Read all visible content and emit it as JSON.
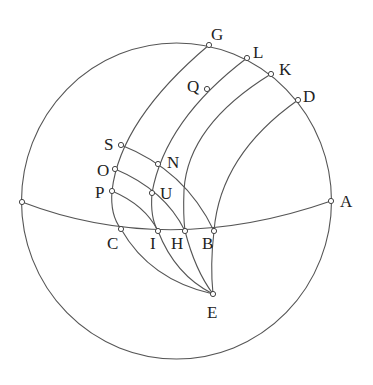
{
  "diagram": {
    "type": "spherical-geometry-figure",
    "sphere": {
      "cx": 176.5,
      "cy": 201,
      "rx": 155,
      "ry": 158
    },
    "points": {
      "A": {
        "x": 331,
        "y": 201,
        "lx": 340,
        "ly": 207
      },
      "B": {
        "x": 214,
        "y": 231,
        "lx": 202,
        "ly": 249
      },
      "C": {
        "x": 121,
        "y": 229,
        "lx": 107,
        "ly": 249
      },
      "D": {
        "x": 298,
        "y": 100,
        "lx": 303,
        "ly": 102
      },
      "E": {
        "x": 213,
        "y": 294,
        "lx": 207,
        "ly": 318
      },
      "G": {
        "x": 209,
        "y": 45,
        "lx": 211,
        "ly": 40
      },
      "H": {
        "x": 185,
        "y": 231,
        "lx": 171,
        "ly": 249
      },
      "I": {
        "x": 158,
        "y": 231,
        "lx": 150,
        "ly": 249
      },
      "K": {
        "x": 271,
        "y": 74,
        "lx": 279,
        "ly": 75
      },
      "L": {
        "x": 247,
        "y": 58,
        "lx": 253,
        "ly": 58
      },
      "N": {
        "x": 158,
        "y": 164,
        "lx": 167,
        "ly": 168
      },
      "O": {
        "x": 115,
        "y": 169,
        "lx": 97,
        "ly": 176
      },
      "P": {
        "x": 112,
        "y": 191,
        "lx": 95,
        "ly": 198
      },
      "Q": {
        "x": 207,
        "y": 89,
        "lx": 187,
        "ly": 92
      },
      "S": {
        "x": 121,
        "y": 145,
        "lx": 104,
        "ly": 150
      },
      "U": {
        "x": 152,
        "y": 193,
        "lx": 160,
        "ly": 199
      },
      "W": {
        "x": 22,
        "y": 202
      }
    },
    "labels": [
      "A",
      "B",
      "C",
      "D",
      "E",
      "G",
      "H",
      "I",
      "K",
      "L",
      "N",
      "O",
      "P",
      "Q",
      "S",
      "U"
    ],
    "curves": {
      "equator": "M22,202 Q168,258 331,201",
      "arc_G_C": "M209,45 Q120,120 112,191 Q110,215 121,229",
      "arc_L_I": "M247,58 Q165,120 152,193 Q150,218 158,231",
      "arc_K_H": "M271,74 Q188,125 184,190 Q183,215 185,231",
      "arc_D_B": "M298,100 Q220,155 214,231",
      "arc_S_B": "M121,145 Q185,170 214,231",
      "arc_O_H": "M115,169 Q165,190 185,231",
      "arc_P_I": "M112,191 Q145,205 158,231",
      "arc_C_E": "M121,229 Q150,280 213,294",
      "arc_I_E": "M158,231 Q175,275 213,294",
      "arc_H_E": "M185,231 Q195,270 213,294",
      "arc_B_E": "M214,231 Q210,265 213,294"
    }
  }
}
